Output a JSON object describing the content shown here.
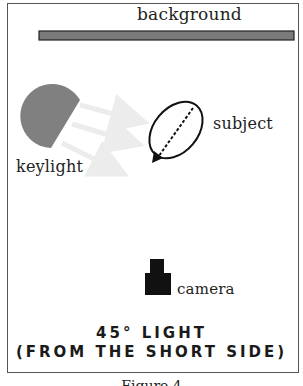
{
  "diagram": {
    "labels": {
      "background": "background",
      "subject": "subject",
      "keylight": "keylight",
      "camera": "camera"
    },
    "title_lines": [
      "45° LIGHT",
      "(FROM THE SHORT SIDE)"
    ],
    "caption": "Figure 4",
    "colors": {
      "background_bar": "#7a7a7a",
      "keylight": "#808080",
      "light_rays": "#ececec",
      "subject_outline": "#111111",
      "camera": "#111111",
      "frame": "#555555"
    }
  }
}
